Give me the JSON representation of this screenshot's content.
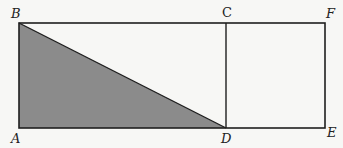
{
  "diagram": {
    "type": "geometry",
    "colors": {
      "stroke": "#1e1e1e",
      "shade": "#8b8b8b",
      "background": "#f7f7f5"
    },
    "points": {
      "A": {
        "label": "A",
        "x": 19,
        "y": 128
      },
      "B": {
        "label": "B",
        "x": 19,
        "y": 23
      },
      "C": {
        "label": "C",
        "x": 226,
        "y": 23
      },
      "D": {
        "label": "D",
        "x": 226,
        "y": 128
      },
      "E": {
        "label": "E",
        "x": 325,
        "y": 128
      },
      "F": {
        "label": "F",
        "x": 325,
        "y": 23
      }
    },
    "segments": [
      "AB",
      "BF",
      "FE",
      "EA",
      "CD",
      "BD"
    ],
    "shaded_region": [
      "A",
      "B",
      "D"
    ]
  }
}
